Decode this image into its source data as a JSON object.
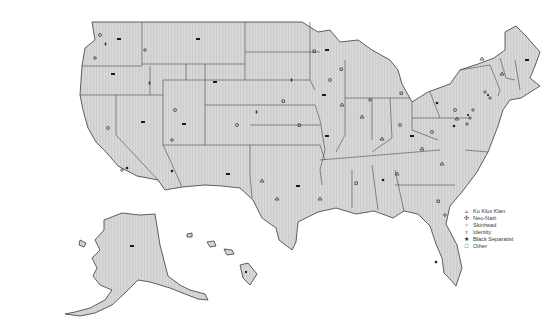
{
  "map": {
    "subject": "United States hate group locations",
    "regions": [
      "Contiguous United States",
      "Alaska",
      "Hawaii"
    ]
  },
  "legend": {
    "items": [
      {
        "symbol": "triangle-icon",
        "glyph": "▵",
        "label": "Ku Klux Klan"
      },
      {
        "symbol": "swastika-cross-icon",
        "glyph": "✣",
        "label": "Neo-Nazi"
      },
      {
        "symbol": "circle-icon",
        "glyph": "○",
        "label": "Skinhead"
      },
      {
        "symbol": "identity-icon",
        "glyph": "♆",
        "label": "Identity"
      },
      {
        "symbol": "star-icon",
        "glyph": "★",
        "label": "Black Separatist"
      },
      {
        "symbol": "square-icon",
        "glyph": "□",
        "label": "Other"
      }
    ]
  },
  "colors": {
    "land_fill": "#d6d6d6",
    "stripe": "#c4c4c4",
    "border": "#3a3a3a",
    "marker": "#2a2a2a",
    "background": "#ffffff"
  }
}
